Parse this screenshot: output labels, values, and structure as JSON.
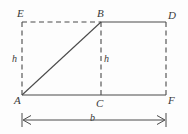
{
  "figure": {
    "type": "geometry-diagram",
    "stroke_color": "#4a4a4a",
    "label_color": "#3a3a3a",
    "background_color": "#fdfdfd",
    "vertices": [
      {
        "id": "E",
        "label": "E",
        "x": 22,
        "y": 22
      },
      {
        "id": "B",
        "label": "B",
        "x": 101,
        "y": 22
      },
      {
        "id": "D",
        "label": "D",
        "x": 166,
        "y": 22
      },
      {
        "id": "A",
        "label": "A",
        "x": 22,
        "y": 95
      },
      {
        "id": "C",
        "label": "C",
        "x": 101,
        "y": 95
      },
      {
        "id": "F",
        "label": "F",
        "x": 166,
        "y": 95
      }
    ],
    "segments": [
      {
        "id": "EB",
        "from": "E",
        "to": "B",
        "style": "dashed"
      },
      {
        "id": "BD",
        "from": "B",
        "to": "D",
        "style": "solid"
      },
      {
        "id": "AE",
        "from": "A",
        "to": "E",
        "style": "dashed"
      },
      {
        "id": "BC",
        "from": "B",
        "to": "C",
        "style": "dashed"
      },
      {
        "id": "DF",
        "from": "D",
        "to": "F",
        "style": "dashed"
      },
      {
        "id": "AF",
        "from": "A",
        "to": "F",
        "style": "solid"
      },
      {
        "id": "AB",
        "from": "A",
        "to": "B",
        "style": "solid"
      }
    ],
    "measures": {
      "height_left": "h",
      "height_middle": "h",
      "base": "b"
    },
    "dimension_arrow": {
      "id": "base-dimension",
      "label": "b",
      "x_start": 22,
      "x_end": 166,
      "y": 120,
      "double_headed": true,
      "has_end_ticks": true
    }
  }
}
